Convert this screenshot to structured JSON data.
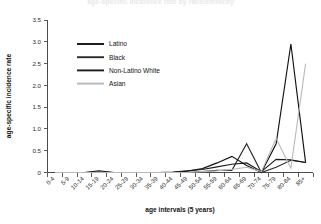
{
  "figure": {
    "title": "age-specific incidence rate by race/ethnicity",
    "background": "#ffffff"
  },
  "axis": {
    "x_title": "age intervals (5 years)",
    "y_title": "age-specific incidence rate"
  },
  "legend": {
    "position": "upper-left-inside",
    "entries": [
      {
        "label": "Latino",
        "color": "#111111"
      },
      {
        "label": "Black",
        "color": "#2a2a2a"
      },
      {
        "label": "Non-Latino White",
        "color": "#1c1c1c"
      },
      {
        "label": "Asian",
        "color": "#b9b9b9"
      }
    ]
  },
  "chart_data": {
    "type": "line",
    "title": "age-specific incidence rate by race/ethnicity",
    "xlabel": "age intervals (5 years)",
    "ylabel": "age-specific incidence rate",
    "ylim": [
      0,
      3.5
    ],
    "yticks": [
      "0",
      "0.5",
      "1.0",
      "1.5",
      "2.0",
      "2.5",
      "3.0",
      "3.5"
    ],
    "ytick_values": [
      0,
      0.5,
      1.0,
      1.5,
      2.0,
      2.5,
      3.0,
      3.5
    ],
    "grid": false,
    "legend_position": "upper-left",
    "categories": [
      "0-4",
      "5-9",
      "10-14",
      "15-19",
      "20-24",
      "25-29",
      "30-34",
      "35-39",
      "40-44",
      "45-49",
      "50-54",
      "55-59",
      "60-64",
      "65-69",
      "70-74",
      "75-79",
      "80-84",
      "85+"
    ],
    "series": [
      {
        "name": "Latino",
        "color": "#111111",
        "values": [
          0,
          0,
          0,
          0.04,
          0,
          0,
          0,
          0,
          0,
          0.03,
          0.09,
          0.22,
          0.37,
          0.16,
          0,
          0.66,
          2.95,
          0.22
        ]
      },
      {
        "name": "Black",
        "color": "#2a2a2a",
        "values": [
          0,
          0,
          0,
          0,
          0,
          0,
          0,
          0,
          0,
          0,
          0.02,
          0.05,
          0.05,
          0.66,
          0,
          0.12,
          0.28,
          0.23
        ]
      },
      {
        "name": "Non-Latino White",
        "color": "#1c1c1c",
        "values": [
          0,
          0,
          0,
          0.01,
          0,
          0,
          0,
          0,
          0.01,
          0.04,
          0.07,
          0.13,
          0.19,
          0.22,
          0.02,
          0.3,
          0.29,
          0.23
        ]
      },
      {
        "name": "Asian",
        "color": "#b9b9b9",
        "values": [
          0,
          0,
          0,
          0,
          0,
          0,
          0,
          0,
          0,
          0,
          0.02,
          0.04,
          0.07,
          0.12,
          0.02,
          0.78,
          0.1,
          2.5
        ]
      }
    ]
  }
}
